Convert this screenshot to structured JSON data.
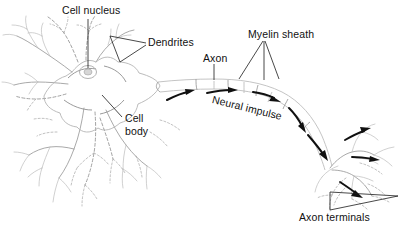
{
  "figure": {
    "background_color": "#ffffff",
    "label_color": "#111111",
    "sketch_color": "#9a9a9a",
    "arrow_color": "#101010"
  },
  "labels": {
    "cell_nucleus": "Cell nucleus",
    "dendrites": "Dendrites",
    "axon": "Axon",
    "myelin_sheath": "Myelin sheath",
    "neural_impulse": "Neural impulse",
    "cell_body_line1": "Cell",
    "cell_body_line2": "body",
    "axon_terminals": "Axon terminals"
  },
  "parts": [
    {
      "id": "cell-nucleus",
      "label": "Cell nucleus",
      "x": 62,
      "y": 5,
      "leader": true
    },
    {
      "id": "dendrites",
      "label": "Dendrites",
      "x": 148,
      "y": 38,
      "leader": true
    },
    {
      "id": "axon",
      "label": "Axon",
      "x": 204,
      "y": 53,
      "leader": true
    },
    {
      "id": "myelin-sheath",
      "label": "Myelin sheath",
      "x": 250,
      "y": 30,
      "leader": true
    },
    {
      "id": "neural-impulse",
      "label": "Neural impulse",
      "x": 216,
      "y": 94,
      "leader": false
    },
    {
      "id": "cell-body",
      "label": "Cell body",
      "x": 125,
      "y": 113,
      "leader": true
    },
    {
      "id": "axon-terminals",
      "label": "Axon terminals",
      "x": 300,
      "y": 212,
      "leader": true
    }
  ],
  "arrows": {
    "neural_impulse_count": 4,
    "axon_terminal_count": 5,
    "direction": "left-to-right, soma to axon terminals"
  }
}
